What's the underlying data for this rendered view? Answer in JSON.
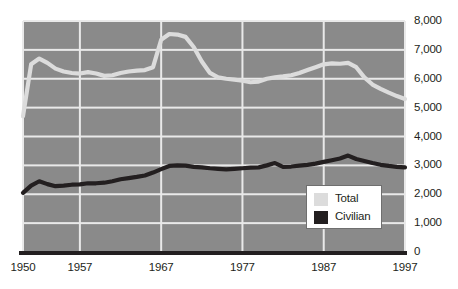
{
  "chart_data": {
    "type": "line",
    "title": "",
    "subtitle": "",
    "xlabel": "",
    "ylabel": "",
    "xlim": [
      1950,
      1997
    ],
    "ylim": [
      0,
      8000
    ],
    "grid": true,
    "legend_position": "bottom-right",
    "plot_background": "#8a8a8a",
    "gridline_color": "#e9e9e9",
    "x_ticks": [
      "1950",
      "1957",
      "1967",
      "1977",
      "1987",
      "1997"
    ],
    "x_tick_values": [
      1950,
      1957,
      1967,
      1977,
      1987,
      1997
    ],
    "y_ticks": [
      "0",
      "1,000",
      "2,000",
      "3,000",
      "4,000",
      "5,000",
      "6,000",
      "7,000",
      "8,000"
    ],
    "y_tick_values": [
      0,
      1000,
      2000,
      3000,
      4000,
      5000,
      6000,
      7000,
      8000
    ],
    "x": [
      1950,
      1951,
      1952,
      1953,
      1954,
      1955,
      1956,
      1957,
      1958,
      1959,
      1960,
      1961,
      1962,
      1963,
      1964,
      1965,
      1966,
      1967,
      1968,
      1969,
      1970,
      1971,
      1972,
      1973,
      1974,
      1975,
      1976,
      1977,
      1978,
      1979,
      1980,
      1981,
      1982,
      1983,
      1984,
      1985,
      1986,
      1987,
      1988,
      1989,
      1990,
      1991,
      1992,
      1993,
      1994,
      1995,
      1996,
      1997
    ],
    "series": [
      {
        "name": "Total",
        "color": "#dcdcdc",
        "values": [
          4700,
          6500,
          6700,
          6550,
          6350,
          6250,
          6200,
          6180,
          6230,
          6180,
          6100,
          6120,
          6200,
          6250,
          6280,
          6300,
          6400,
          7350,
          7550,
          7530,
          7450,
          7100,
          6600,
          6200,
          6050,
          6000,
          5970,
          5930,
          5880,
          5900,
          6000,
          6050,
          6080,
          6120,
          6200,
          6300,
          6400,
          6500,
          6530,
          6520,
          6550,
          6400,
          6050,
          5800,
          5650,
          5520,
          5400,
          5300
        ]
      },
      {
        "name": "Civilian",
        "color": "#231f20",
        "values": [
          2050,
          2300,
          2450,
          2350,
          2280,
          2300,
          2330,
          2340,
          2380,
          2380,
          2400,
          2450,
          2520,
          2560,
          2600,
          2650,
          2750,
          2870,
          2980,
          3000,
          2990,
          2950,
          2930,
          2900,
          2880,
          2860,
          2880,
          2900,
          2920,
          2930,
          3000,
          3080,
          2950,
          2960,
          2990,
          3020,
          3060,
          3120,
          3180,
          3240,
          3340,
          3220,
          3150,
          3080,
          3020,
          2980,
          2950,
          2930
        ]
      }
    ],
    "legend": [
      {
        "label": "Total",
        "color": "#dcdcdc"
      },
      {
        "label": "Civilian",
        "color": "#231f20"
      }
    ]
  }
}
